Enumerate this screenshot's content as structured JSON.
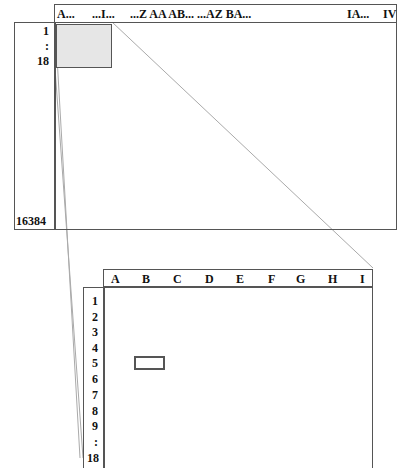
{
  "overview": {
    "column_header": {
      "labels": [
        "A...",
        "...I...",
        "...Z AA AB... ...AZ BA...",
        "IA...",
        "IV"
      ]
    },
    "row_header": {
      "labels": [
        "1",
        ":",
        "18",
        "16384"
      ]
    },
    "highlight_region": {
      "color": "#e6e6e6",
      "range": "A1:I18"
    }
  },
  "detail": {
    "columns": [
      "A",
      "B",
      "C",
      "D",
      "E",
      "F",
      "G",
      "H",
      "I"
    ],
    "rows": [
      "1",
      "2",
      "3",
      "4",
      "5",
      "6",
      "7",
      "8",
      "9",
      ":",
      "18"
    ],
    "selected_cell": {
      "column": "B",
      "row": "5"
    }
  },
  "colors": {
    "border": "#555555",
    "zoom_lines": "#a0a0a0",
    "highlight": "#e6e6e6"
  }
}
